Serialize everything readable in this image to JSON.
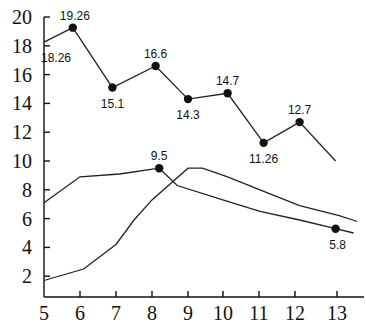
{
  "chart_data": {
    "type": "line",
    "title": "",
    "xlabel": "",
    "ylabel": "",
    "xlim": [
      5,
      13.7
    ],
    "ylim": [
      0.55,
      20
    ],
    "grid": false,
    "legend": null,
    "x_ticks": [
      "5",
      "6",
      "7",
      "8",
      "9",
      "10",
      "11",
      "12",
      "13"
    ],
    "y_ticks": [
      "2",
      "4",
      "6",
      "8",
      "10",
      "12",
      "14",
      "16",
      "18",
      "20"
    ],
    "series": [
      {
        "name": "series-top",
        "x": [
          5,
          5.8,
          6.9,
          8.1,
          9.0,
          10.1,
          11.1,
          12.1,
          13.1
        ],
        "values": [
          18.26,
          19.26,
          15.1,
          16.6,
          14.3,
          14.7,
          11.26,
          12.7,
          10.0
        ],
        "labels": [
          "18.26",
          "19.26",
          "15.1",
          "16.6",
          "14.3",
          "14.7",
          "11.26",
          "12.7",
          ""
        ],
        "markers": [
          false,
          true,
          true,
          true,
          true,
          true,
          true,
          true,
          false
        ]
      },
      {
        "name": "series-early-peak",
        "x": [
          5,
          6.0,
          7.1,
          8.2,
          8.7,
          10.1,
          11.0,
          12.1,
          13.1,
          13.6
        ],
        "values": [
          7.1,
          8.9,
          9.1,
          9.5,
          8.3,
          7.2,
          6.5,
          5.9,
          5.3,
          5.0
        ],
        "labels": [
          "",
          "",
          "",
          "9.5",
          "",
          "",
          "",
          "",
          "5.8",
          ""
        ],
        "markers": [
          false,
          false,
          false,
          true,
          false,
          false,
          false,
          false,
          true,
          false
        ]
      },
      {
        "name": "series-late-peak",
        "x": [
          5,
          6.1,
          7.0,
          7.5,
          8.0,
          9.0,
          9.4,
          10.1,
          11.0,
          12.1,
          13.2,
          13.7
        ],
        "values": [
          1.7,
          2.5,
          4.2,
          5.9,
          7.3,
          9.5,
          9.5,
          8.9,
          8.0,
          6.9,
          6.2,
          5.8
        ],
        "labels": [],
        "markers": []
      }
    ],
    "annotations": [
      "19.26",
      "18.26",
      "16.6",
      "15.1",
      "14.7",
      "14.3",
      "12.7",
      "11.26",
      "9.5",
      "5.8"
    ]
  }
}
